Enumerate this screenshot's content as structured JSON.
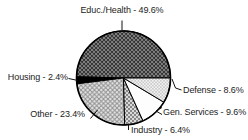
{
  "chart_data": {
    "type": "pie",
    "title": "",
    "unit": "%",
    "start_angle_deg": 0,
    "direction": "ccw",
    "legend_position": "callout-labels-around-pie",
    "grid": false,
    "slices": [
      {
        "label": "Educ./Health",
        "value": 49.6,
        "display": "Educ./Health - 49.6%",
        "pattern": "crosshatch-dark"
      },
      {
        "label": "Housing",
        "value": 2.4,
        "display": "Housing - 2.4%",
        "pattern": "solid-black"
      },
      {
        "label": "Other",
        "value": 23.4,
        "display": "Other - 23.4%",
        "pattern": "crosshatch-light"
      },
      {
        "label": "Industry",
        "value": 6.4,
        "display": "Industry - 6.4%",
        "pattern": "dots-medium"
      },
      {
        "label": "Gen. Services",
        "value": 9.6,
        "display": "Gen. Services - 9.6%",
        "pattern": "plain-white"
      },
      {
        "label": "Defense",
        "value": 8.6,
        "display": "Defense - 8.6%",
        "pattern": "dots-fine"
      }
    ],
    "colors": {
      "outline": "#000000",
      "text": "#1c1c1c",
      "background": "#ffffff"
    }
  }
}
